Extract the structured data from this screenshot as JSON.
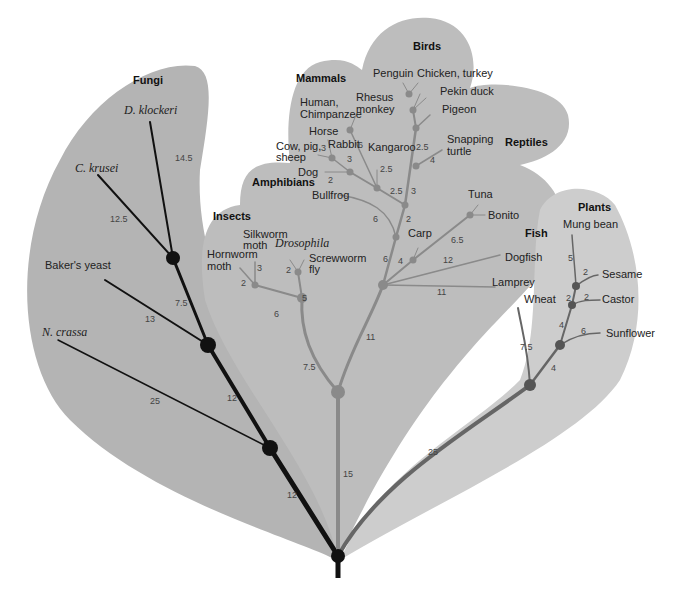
{
  "colors": {
    "background": "#ffffff",
    "fungi_region": "#b4b4b4",
    "animal_region": "#bdbdbd",
    "plant_region": "#cdcdcd",
    "fungi_branch": "#111111",
    "animal_branch": "#8a8a8a",
    "plant_branch": "#666666",
    "root_node": "#111111"
  },
  "groups": {
    "fungi": "Fungi",
    "mammals": "Mammals",
    "birds": "Birds",
    "reptiles": "Reptiles",
    "amphibians": "Amphibians",
    "insects": "Insects",
    "fish": "Fish",
    "plants": "Plants"
  },
  "species": {
    "d_klockeri": "D. klockeri",
    "c_krusei": "C. krusei",
    "bakers_yeast": "Baker's yeast",
    "n_crassa": "N. crassa",
    "human": "Human,",
    "chimp": "Chimpanzee",
    "rhesus1": "Rhesus",
    "rhesus2": "monkey",
    "horse": "Horse",
    "cow1": "Cow, pig,",
    "cow2": "sheep",
    "rabbit": "Rabbit",
    "dog": "Dog",
    "kangaroo": "Kangaroo",
    "penguin": "Penguin",
    "chicken": "Chicken, turkey",
    "pekin": "Pekin duck",
    "pigeon": "Pigeon",
    "snapping1": "Snapping",
    "snapping2": "turtle",
    "bullfrog": "Bullfrog",
    "silkworm1": "Silkworm",
    "silkworm2": "moth",
    "drosophila": "Drosophila",
    "hornworm1": "Hornworm",
    "hornworm2": "moth",
    "screwworm1": "Screwworm",
    "screwworm2": "fly",
    "tuna": "Tuna",
    "bonito": "Bonito",
    "carp": "Carp",
    "dogfish": "Dogfish",
    "lamprey": "Lamprey",
    "mung": "Mung bean",
    "sesame": "Sesame",
    "castor": "Castor",
    "wheat": "Wheat",
    "sunflower": "Sunflower"
  },
  "distances": {
    "d_klockeri": "14.5",
    "c_krusei": "12.5",
    "fungi_inner1": "7.5",
    "bakers_yeast": "13",
    "n_crassa": "25",
    "fungi_inner2": "12",
    "fungi_root": "12",
    "animal_trunk": "15",
    "insects_trunk": "7.5",
    "vert_trunk": "11",
    "hornworm": "2",
    "silkworm": "3",
    "moth_branch": "6",
    "drosophila": "2",
    "fly_branch": "5",
    "cow": "3",
    "rabbit": "3",
    "horse_branch": "6",
    "dog": "2",
    "kangaroo": "2.5",
    "mammal_trunk": "2.5",
    "bird_trunk": "3",
    "bird_upper": "2.5",
    "snapping": "4",
    "amniote": "2",
    "bullfrog": "6",
    "tetrapod": "6",
    "carp": "4",
    "tuna_branch": "6.5",
    "dogfish": "12",
    "lamprey": "11",
    "plant_trunk": "25",
    "wheat": "7.5",
    "dicot": "4",
    "sunflower": "6",
    "castor_node": "4",
    "castor": "2",
    "castor_inner": "2",
    "sesame": "2",
    "mung": "5"
  }
}
